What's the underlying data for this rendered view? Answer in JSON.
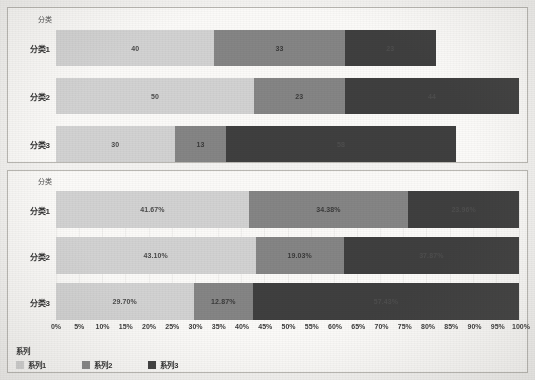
{
  "chart_data": [
    {
      "type": "bar",
      "id": "stacked-absolute",
      "orientation": "horizontal",
      "stacked": true,
      "title": "",
      "xlabel": "",
      "ylabel": "分类",
      "axis_title": "分类",
      "categories": [
        "分类1",
        "分类2",
        "分类3"
      ],
      "series": [
        {
          "name": "系列1",
          "values": [
            40,
            50,
            30
          ],
          "color": "#d2d2d2"
        },
        {
          "name": "系列2",
          "values": [
            33,
            23,
            13
          ],
          "color": "#858585"
        },
        {
          "name": "系列3",
          "values": [
            23,
            44,
            58
          ],
          "color": "#3f3f3f"
        }
      ],
      "totals": [
        96,
        117,
        101
      ],
      "xlim": [
        0,
        117
      ],
      "grid": false,
      "legend": "none",
      "data_labels": [
        [
          "40",
          "33",
          "23"
        ],
        [
          "50",
          "23",
          "44"
        ],
        [
          "30",
          "13",
          "58"
        ]
      ]
    },
    {
      "type": "bar",
      "id": "stacked-percent",
      "orientation": "horizontal",
      "stacked": true,
      "stack_mode": "100%",
      "title": "",
      "xlabel": "",
      "ylabel": "分类",
      "axis_title": "分类",
      "categories": [
        "分类1",
        "分类2",
        "分类3"
      ],
      "series": [
        {
          "name": "系列1",
          "values": [
            41.67,
            43.1,
            29.7
          ],
          "color": "#d2d2d2"
        },
        {
          "name": "系列2",
          "values": [
            34.38,
            19.03,
            12.87
          ],
          "color": "#858585"
        },
        {
          "name": "系列3",
          "values": [
            23.96,
            37.87,
            57.43
          ],
          "color": "#3f3f3f"
        }
      ],
      "xlim": [
        0,
        100
      ],
      "xticks": [
        "0%",
        "5%",
        "10%",
        "15%",
        "20%",
        "25%",
        "30%",
        "35%",
        "40%",
        "45%",
        "50%",
        "55%",
        "60%",
        "65%",
        "70%",
        "75%",
        "80%",
        "85%",
        "90%",
        "95%",
        "100%"
      ],
      "grid": true,
      "legend": "bottom-left",
      "legend_title": "系列",
      "data_labels": [
        [
          "41.67%",
          "34.38%",
          "23.96%"
        ],
        [
          "43.10%",
          "19.03%",
          "37.87%"
        ],
        [
          "29.70%",
          "12.87%",
          "57.43%"
        ]
      ]
    }
  ],
  "colors": {
    "series1": "#d2d2d2",
    "series2": "#858585",
    "series3": "#3f3f3f",
    "panel_background": "#fbfaf8",
    "page_background": "#f4f3f1",
    "border": "#b9b7b2",
    "text": "#2e2e2e"
  }
}
